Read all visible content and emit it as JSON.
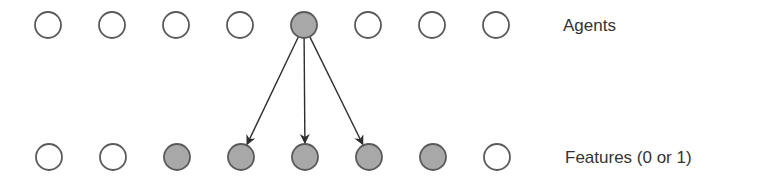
{
  "diagram": {
    "colors": {
      "stroke": "#5a5a5a",
      "filled": "#a8a8a8",
      "empty": "#ffffff",
      "arrow": "#2e2e2e",
      "text": "#333333"
    },
    "agents_row": {
      "label": "Agents",
      "y": 25,
      "nodes": [
        {
          "x": 48,
          "filled": false
        },
        {
          "x": 112,
          "filled": false
        },
        {
          "x": 176,
          "filled": false
        },
        {
          "x": 240,
          "filled": false
        },
        {
          "x": 304,
          "filled": true
        },
        {
          "x": 368,
          "filled": false
        },
        {
          "x": 432,
          "filled": false
        },
        {
          "x": 496,
          "filled": false
        }
      ]
    },
    "features_row": {
      "label": "Features (0 or 1)",
      "y": 157,
      "nodes": [
        {
          "x": 49,
          "filled": false
        },
        {
          "x": 113,
          "filled": false
        },
        {
          "x": 177,
          "filled": true
        },
        {
          "x": 241,
          "filled": true
        },
        {
          "x": 305,
          "filled": true
        },
        {
          "x": 369,
          "filled": true
        },
        {
          "x": 433,
          "filled": true
        },
        {
          "x": 497,
          "filled": false
        }
      ]
    },
    "arrows": [
      {
        "from_agent": 4,
        "to_feature": 3
      },
      {
        "from_agent": 4,
        "to_feature": 4
      },
      {
        "from_agent": 4,
        "to_feature": 5
      }
    ]
  }
}
